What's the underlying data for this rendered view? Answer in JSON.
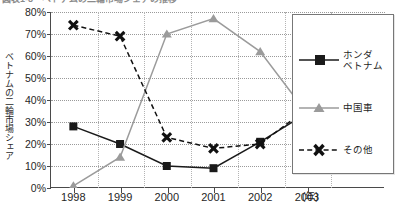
{
  "title": "図表1-8　ベトナムの二輪市場シェアの推移",
  "axis": {
    "y_label": "ベトナムの二輪市場シェア",
    "x_unit": "(年)",
    "y_ticks": [
      "80%",
      "70%",
      "60%",
      "50%",
      "40%",
      "30%",
      "20%",
      "10%",
      "0%"
    ],
    "x_ticks": [
      "1998",
      "1999",
      "2000",
      "2001",
      "2002",
      "2003"
    ]
  },
  "legend": {
    "items": [
      {
        "label_line1": "ホンダ",
        "label_line2": "ベトナム",
        "marker": "square-marker",
        "color": "#1a1a1a"
      },
      {
        "label_line1": "中国車",
        "label_line2": "",
        "marker": "triangle-marker",
        "color": "#9b9b9b"
      },
      {
        "label_line1": "その他",
        "label_line2": "",
        "marker": "x-marker",
        "color": "#111111"
      }
    ]
  },
  "chart_data": {
    "type": "line",
    "title": "ベトナムの二輪市場シェアの推移",
    "xlabel": "(年)",
    "ylabel": "ベトナムの二輪市場シェア",
    "categories": [
      "1998",
      "1999",
      "2000",
      "2001",
      "2002",
      "2003"
    ],
    "ylim": [
      0,
      80
    ],
    "ytick_step": 10,
    "grid": true,
    "legend_position": "right",
    "series": [
      {
        "name": "ホンダベトナム",
        "marker": "square",
        "color": "#1a1a1a",
        "linestyle": "solid",
        "values": [
          28,
          20,
          10,
          9,
          21,
          34
        ]
      },
      {
        "name": "中国車",
        "marker": "triangle",
        "color": "#9b9b9b",
        "linestyle": "solid",
        "values": [
          1,
          14,
          70,
          77,
          62,
          34
        ]
      },
      {
        "name": "その他",
        "marker": "x",
        "color": "#111111",
        "linestyle": "dashed",
        "values": [
          74,
          69,
          23,
          18,
          20,
          36
        ]
      }
    ]
  }
}
